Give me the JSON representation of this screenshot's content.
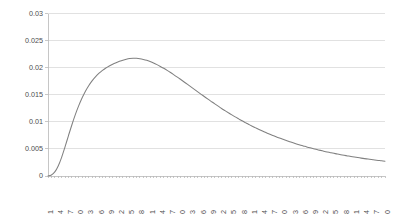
{
  "chart_data": {
    "type": "line",
    "title": "",
    "subtitle": "",
    "xlabel": "",
    "ylabel": "",
    "legend": [],
    "legend_position": "none",
    "grid": true,
    "grid_axis": "y",
    "background_color": "#ffffff",
    "line_color": "#808080",
    "grid_color": "#d4d4d4",
    "axis_color": "#b8b8b8",
    "tick_label_color": "#4d4d4d",
    "xlim": [
      1,
      100
    ],
    "ylim": [
      0,
      0.03
    ],
    "ytick_labels": [
      "0",
      "0.005",
      "0.01",
      "0.015",
      "0.02",
      "0.025",
      "0.03"
    ],
    "ytick_values": [
      0,
      0.005,
      0.01,
      0.015,
      0.02,
      0.025,
      0.03
    ],
    "xtick_labels": [
      "1",
      "4",
      "7",
      "10",
      "13",
      "16",
      "19",
      "22",
      "25",
      "28",
      "31",
      "34",
      "37",
      "40",
      "43",
      "46",
      "49",
      "52",
      "55",
      "58",
      "61",
      "64",
      "67",
      "70",
      "73",
      "76",
      "79",
      "82",
      "85",
      "88",
      "91",
      "94",
      "97",
      "100"
    ],
    "xtick_rotation": -90,
    "x": [
      1,
      2,
      3,
      4,
      5,
      6,
      7,
      8,
      9,
      10,
      11,
      12,
      13,
      14,
      15,
      16,
      17,
      18,
      19,
      20,
      21,
      22,
      23,
      24,
      25,
      26,
      27,
      28,
      29,
      30,
      31,
      32,
      33,
      34,
      35,
      36,
      37,
      38,
      39,
      40,
      41,
      42,
      43,
      44,
      45,
      46,
      47,
      48,
      49,
      50,
      51,
      52,
      53,
      54,
      55,
      56,
      57,
      58,
      59,
      60,
      61,
      62,
      63,
      64,
      65,
      66,
      67,
      68,
      69,
      70,
      71,
      72,
      73,
      74,
      75,
      76,
      77,
      78,
      79,
      80,
      81,
      82,
      83,
      84,
      85,
      86,
      87,
      88,
      89,
      90,
      91,
      92,
      93,
      94,
      95,
      96,
      97,
      98,
      99,
      100
    ],
    "values": [
      2e-05,
      0.00018,
      0.00075,
      0.00185,
      0.00345,
      0.00538,
      0.00742,
      0.00942,
      0.01128,
      0.01294,
      0.0144,
      0.01566,
      0.01672,
      0.01762,
      0.01836,
      0.01898,
      0.0195,
      0.01994,
      0.02031,
      0.02064,
      0.02092,
      0.02117,
      0.02139,
      0.02156,
      0.02168,
      0.02173,
      0.02172,
      0.02165,
      0.02152,
      0.02135,
      0.02112,
      0.02086,
      0.02056,
      0.02023,
      0.01988,
      0.0195,
      0.0191,
      0.01868,
      0.01825,
      0.01781,
      0.01736,
      0.01691,
      0.01645,
      0.01599,
      0.01553,
      0.01508,
      0.01463,
      0.01418,
      0.01374,
      0.01331,
      0.01289,
      0.01247,
      0.01207,
      0.01167,
      0.01129,
      0.01091,
      0.01055,
      0.01019,
      0.00985,
      0.00952,
      0.0092,
      0.00889,
      0.00859,
      0.0083,
      0.00802,
      0.00775,
      0.00749,
      0.00724,
      0.007,
      0.00677,
      0.00655,
      0.00633,
      0.00612,
      0.00592,
      0.00573,
      0.00555,
      0.00537,
      0.0052,
      0.00504,
      0.00488,
      0.00473,
      0.00458,
      0.00444,
      0.00431,
      0.00418,
      0.00405,
      0.00393,
      0.00382,
      0.00371,
      0.0036,
      0.0035,
      0.0034,
      0.0033,
      0.00321,
      0.00312,
      0.00304,
      0.00296,
      0.00288,
      0.0028,
      0.00273
    ],
    "peak": {
      "x": 26,
      "y": 0.02173
    }
  },
  "plot_geometry": {
    "left": 48,
    "right": 385,
    "top": 13.5,
    "bottom": 176
  }
}
